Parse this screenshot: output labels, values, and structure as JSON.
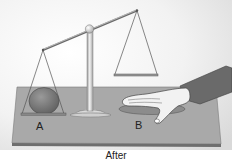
{
  "figure": {
    "caption": "After",
    "labels": {
      "a": "A",
      "b": "B"
    }
  },
  "colors": {
    "background": "#ffffff",
    "board_top": "#a7a7a7",
    "board_edge": "#6e6e6e",
    "ball": "#7d7d7d",
    "metal": "#d8d8d8",
    "sleeve": "#6a6a6a",
    "skin": "#f2f2f2"
  }
}
